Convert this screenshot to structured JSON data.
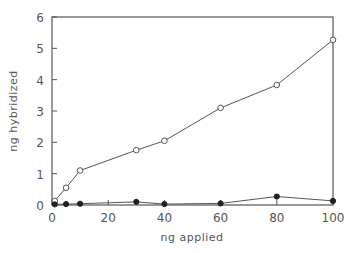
{
  "chart_data": {
    "type": "line",
    "title": "",
    "xlabel": "ng applied",
    "ylabel": "ng hybridized",
    "xlim": [
      0,
      100
    ],
    "ylim": [
      0,
      6
    ],
    "xticks": [
      0,
      20,
      40,
      60,
      80,
      100
    ],
    "yticks": [
      0,
      1,
      2,
      3,
      4,
      5,
      6
    ],
    "grid": false,
    "legend": null,
    "series": [
      {
        "name": "open circles",
        "marker": "open-circle",
        "x": [
          1,
          5,
          10,
          30,
          40,
          60,
          80,
          100
        ],
        "values": [
          0.13,
          0.55,
          1.1,
          1.75,
          2.05,
          3.1,
          3.83,
          5.27
        ]
      },
      {
        "name": "filled circles",
        "marker": "filled-circle",
        "x": [
          1,
          5,
          10,
          30,
          40,
          60,
          80,
          100
        ],
        "values": [
          0.02,
          0.03,
          0.04,
          0.1,
          0.03,
          0.05,
          0.27,
          0.13
        ]
      }
    ]
  },
  "colors": {
    "line": "#555555",
    "text": "#555555"
  }
}
